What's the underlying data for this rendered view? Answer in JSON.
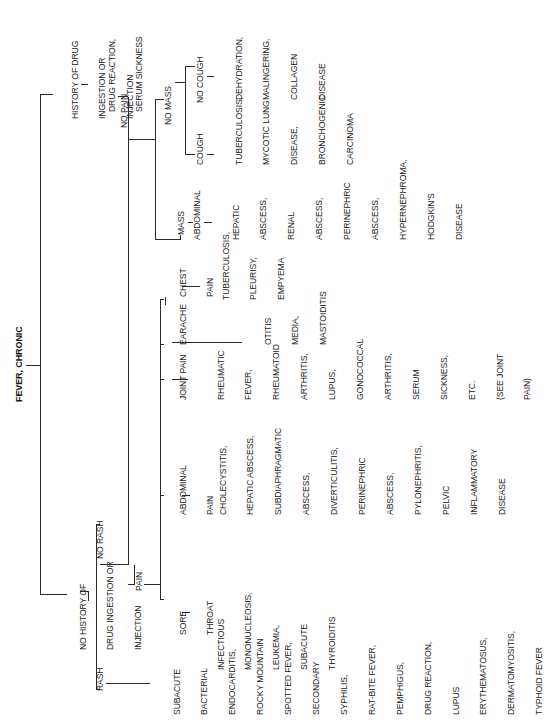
{
  "title": "FEVER, CHRONIC",
  "tree": {
    "root": {
      "label": "FEVER, CHRONIC"
    },
    "history_drug": {
      "label": [
        "HISTORY OF DRUG",
        "INGESTION OR",
        "INJECTION"
      ],
      "result": [
        "DRUG REACTION,",
        "SERUM SICKNESS"
      ]
    },
    "no_history_drug": {
      "label": [
        "NO HISTORY OF",
        "DRUG INGESTION OR",
        "INJECTION"
      ]
    },
    "rash": {
      "label": "RASH",
      "result": [
        "SUBACUTE",
        "BACTERIAL",
        "ENDOCARDITIS,",
        "ROCKY MOUNTAIN",
        "SPOTTED FEVER,",
        "SECONDARY",
        "SYPHILIS,",
        "RAT-BITE FEVER,",
        "PEMPHIGUS,",
        "DRUG REACTION,",
        "LUPUS",
        "ERYTHEMATOSUS,",
        "DERMATOMYOSITIS,",
        "TYPHOID FEVER"
      ]
    },
    "no_rash": {
      "label": "NO RASH"
    },
    "pain": {
      "label": "PAIN",
      "children": [
        {
          "label": [
            "SORE",
            "THROAT"
          ],
          "result": [
            "INFECTIOUS",
            "MONONUCLEOSIS,",
            "LEUKEMIA,",
            "SUBACUTE",
            "THYROIDITIS"
          ]
        },
        {
          "label": [
            "ABDOMINAL",
            "PAIN"
          ],
          "result": [
            "CHOLECYSTITIS,",
            "HEPATIC ABSCESS,",
            "SUBDIAPHRAGMATIC",
            "ABSCESS,",
            "DIVERTICULITIS,",
            "PERINEPHRIC",
            "ABSCESS,",
            "PYLONEPHRITIS,",
            "PELVIC",
            "INFLAMMATORY",
            "DISEASE"
          ]
        },
        {
          "label": [
            "JOINT PAIN"
          ],
          "result": [
            "RHEUMATIC",
            "FEVER,",
            "RHEUMATOID",
            "ARTHRITIS,",
            "LUPUS,",
            "GONOCOCCAL",
            "ARTHRITIS,",
            "SERUM",
            "SICKNESS,",
            "ETC.",
            "(SEE JOINT",
            "PAIN)"
          ]
        },
        {
          "label": [
            "EARACHE"
          ],
          "result": [
            "OTITIS",
            "MEDIA,",
            "MASTOIDITIS"
          ]
        },
        {
          "label": [
            "CHEST",
            "PAIN"
          ],
          "result": [
            "TUBERCULOSIS,",
            "PLEURISY,",
            "EMPYEMA"
          ]
        }
      ]
    },
    "no_pain": {
      "label": "NO PAIN",
      "mass": {
        "label": "MASS",
        "sub": "ABDOMINAL",
        "result": [
          "HEPATIC",
          "ABSCESS,",
          "RENAL",
          "ABSCESS,",
          "PERINEPHRIC",
          "ABSCESS,",
          "HYPERNEPHROMA,",
          "HODGKIN'S",
          "DISEASE"
        ]
      },
      "no_mass": {
        "label": "NO MASS",
        "cough": {
          "label": "COUGH",
          "result": [
            "TUBERCULOSIS,",
            "MYCOTIC LUNG",
            "DISEASE,",
            "BRONCHOGENIC",
            "CARCINOMA"
          ]
        },
        "no_cough": {
          "label": "NO COUGH",
          "result": [
            "DEHYDRATION,",
            "MALINGERING,",
            "COLLAGEN",
            "DISEASE"
          ]
        }
      }
    }
  }
}
